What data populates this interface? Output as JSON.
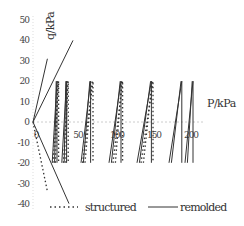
{
  "chart_data": {
    "type": "line",
    "title": "",
    "xlabel": "P/kPa",
    "ylabel": "q/kPa",
    "xlim": [
      0,
      200
    ],
    "ylim": [
      -40,
      50
    ],
    "x_ticks": [
      "0",
      "50",
      "100",
      "150",
      "200"
    ],
    "y_ticks": [
      "50",
      "40",
      "30",
      "20",
      "10",
      "0",
      "-10",
      "-20",
      "-30",
      "-40"
    ],
    "grid": false,
    "legend_position": "bottom",
    "series": [
      {
        "name": "structured",
        "style": "dotted",
        "cycles": [
          {
            "p_min": 25,
            "p_max": 32,
            "q_min": -20,
            "q_max": 20
          },
          {
            "p_min": 38,
            "p_max": 44,
            "q_min": -20,
            "q_max": 20
          },
          {
            "p_min": 62,
            "p_max": 75,
            "q_min": -20,
            "q_max": 20
          },
          {
            "p_min": 100,
            "p_max": 112,
            "q_min": -20,
            "q_max": 20
          },
          {
            "p_min": 135,
            "p_max": 150,
            "q_min": -20,
            "q_max": 20
          }
        ],
        "initial_loading": [
          [
            0,
            0
          ],
          [
            18,
            -34
          ]
        ]
      },
      {
        "name": "remolded",
        "style": "solid",
        "cycles": [
          {
            "p_min": 24,
            "p_max": 30,
            "q_min": -20,
            "q_max": 20
          },
          {
            "p_min": 36,
            "p_max": 42,
            "q_min": -20,
            "q_max": 20
          },
          {
            "p_min": 60,
            "p_max": 72,
            "q_min": -20,
            "q_max": 20
          },
          {
            "p_min": 95,
            "p_max": 110,
            "q_min": -20,
            "q_max": 20
          },
          {
            "p_min": 130,
            "p_max": 148,
            "q_min": -20,
            "q_max": 20
          },
          {
            "p_min": 170,
            "p_max": 186,
            "q_min": -20,
            "q_max": 20
          },
          {
            "p_min": 190,
            "p_max": 200,
            "q_min": -20,
            "q_max": 20
          }
        ],
        "initial_loading": [
          [
            0,
            0
          ],
          [
            18,
            31
          ],
          [
            0,
            0
          ],
          [
            45,
            -40
          ],
          [
            0,
            0
          ],
          [
            50,
            40
          ]
        ]
      }
    ]
  },
  "axes": {
    "x_label": "P/kPa",
    "y_label": "q/kPa",
    "x_ticks": [
      {
        "label": "0",
        "x": 36
      },
      {
        "label": "50",
        "x": 78
      },
      {
        "label": "100",
        "x": 117
      },
      {
        "label": "150",
        "x": 154
      },
      {
        "label": "200",
        "x": 191
      }
    ],
    "y_ticks": [
      {
        "label": "50",
        "y": 20
      },
      {
        "label": "40",
        "y": 40
      },
      {
        "label": "30",
        "y": 61
      },
      {
        "label": "20",
        "y": 81
      },
      {
        "label": "10",
        "y": 102
      },
      {
        "label": "0",
        "y": 122
      },
      {
        "label": "-10",
        "y": 143
      },
      {
        "label": "-20",
        "y": 163
      },
      {
        "label": "-30",
        "y": 184
      },
      {
        "label": "-40",
        "y": 204
      }
    ]
  },
  "legend": {
    "structured": "structured",
    "remolded": "remolded"
  }
}
